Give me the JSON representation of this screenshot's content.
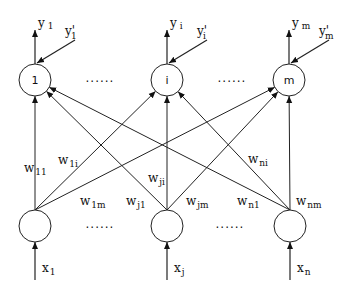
{
  "diagram": {
    "type": "single-layer neural network",
    "output_nodes": [
      {
        "id": "1",
        "label": "1",
        "cx": 35,
        "cy": 80,
        "y_label": "y",
        "y_sub": "1",
        "target_label": "y'",
        "target_sub": "1"
      },
      {
        "id": "i",
        "label": "i",
        "cx": 167,
        "cy": 80,
        "y_label": "y",
        "y_sub": "i",
        "target_label": "y'",
        "target_sub": "i"
      },
      {
        "id": "m",
        "label": "m",
        "cx": 289,
        "cy": 80,
        "y_label": "y",
        "y_sub": "m",
        "target_label": "y'",
        "target_sub": "m"
      }
    ],
    "input_nodes": [
      {
        "id": "1",
        "cx": 35,
        "cy": 226,
        "x_label": "x",
        "x_sub": "1"
      },
      {
        "id": "j",
        "cx": 167,
        "cy": 226,
        "x_label": "x",
        "x_sub": "j"
      },
      {
        "id": "n",
        "cx": 290,
        "cy": 226,
        "x_label": "x",
        "x_sub": "n"
      }
    ],
    "ellipsis": "......",
    "weights": [
      {
        "label": "w",
        "sub": "11",
        "x": 24,
        "y": 172
      },
      {
        "label": "w",
        "sub": "1i",
        "x": 58,
        "y": 164
      },
      {
        "label": "w",
        "sub": "1m",
        "x": 80,
        "y": 205
      },
      {
        "label": "w",
        "sub": "ji",
        "x": 148,
        "y": 182
      },
      {
        "label": "w",
        "sub": "j1",
        "x": 126,
        "y": 205
      },
      {
        "label": "w",
        "sub": "jm",
        "x": 186,
        "y": 205
      },
      {
        "label": "w",
        "sub": "ni",
        "x": 248,
        "y": 163
      },
      {
        "label": "w",
        "sub": "n1",
        "x": 237,
        "y": 205
      },
      {
        "label": "w",
        "sub": "nm",
        "x": 296,
        "y": 205
      }
    ]
  }
}
